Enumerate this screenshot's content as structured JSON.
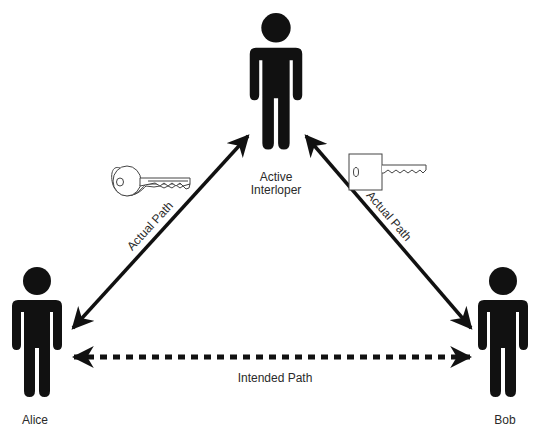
{
  "diagram": {
    "nodes": [
      {
        "id": "interloper",
        "label_line1": "Active",
        "label_line2": "Interloper",
        "icon": "person-icon"
      },
      {
        "id": "alice",
        "label": "Alice",
        "icon": "person-icon"
      },
      {
        "id": "bob",
        "label": "Bob",
        "icon": "person-icon"
      }
    ],
    "edges": [
      {
        "from": "alice",
        "to": "interloper",
        "label": "Actual Path",
        "style": "solid",
        "arrows": "both"
      },
      {
        "from": "interloper",
        "to": "bob",
        "label": "Actual Path",
        "style": "solid",
        "arrows": "both"
      },
      {
        "from": "alice",
        "to": "bob",
        "label": "Intended Path",
        "style": "dashed",
        "arrows": "both"
      }
    ],
    "icons": {
      "left_key": "key-icon",
      "right_key": "key-icon"
    },
    "colors": {
      "figure": "#111111",
      "arrow": "#111111",
      "key_stroke": "#444444",
      "text": "#2a2a2a"
    }
  }
}
